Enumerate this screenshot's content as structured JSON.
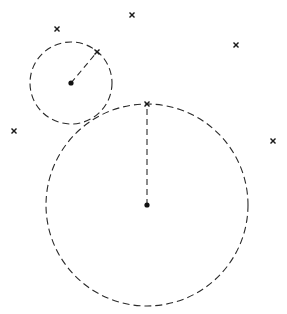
{
  "diagram": {
    "type": "nearest-neighbor-circles",
    "width": 287,
    "height": 314,
    "colors": {
      "background": "#ffffff",
      "stroke": "#2a2a2a",
      "marker": "#1a1a1a",
      "center": "#111111"
    },
    "circles": [
      {
        "id": "small",
        "cx": 71,
        "cy": 83,
        "r": 41,
        "nearest": {
          "x": 97,
          "y": 52
        }
      },
      {
        "id": "large",
        "cx": 147,
        "cy": 205,
        "r": 101,
        "nearest": {
          "x": 147,
          "y": 104
        }
      }
    ],
    "markers": [
      {
        "x": 57,
        "y": 29
      },
      {
        "x": 132,
        "y": 15
      },
      {
        "x": 236,
        "y": 45
      },
      {
        "x": 97,
        "y": 52
      },
      {
        "x": 14,
        "y": 131
      },
      {
        "x": 147,
        "y": 104
      },
      {
        "x": 273,
        "y": 141
      }
    ],
    "marker_glyph": "x-icon",
    "center_glyph": "dot"
  }
}
